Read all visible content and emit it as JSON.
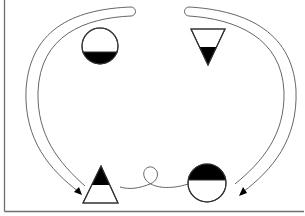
{
  "diagram": {
    "background_color": "#ffffff",
    "line_color": "#555555",
    "fill_color": "#000000",
    "frame": {
      "visible_edges": [
        "left",
        "bottom"
      ],
      "color": "#6e6e6e"
    },
    "shapes": [
      {
        "id": "top-left",
        "type": "circle",
        "filled_part": "bottom",
        "center": [
          100,
          46
        ],
        "radius": 18
      },
      {
        "id": "top-right",
        "type": "triangle-pointing-down",
        "filled_part": "bottom-tip",
        "points": [
          [
            191,
            29
          ],
          [
            225,
            29
          ],
          [
            208,
            65
          ]
        ]
      },
      {
        "id": "bottom-left",
        "type": "triangle-pointing-up",
        "filled_part": "top-tip",
        "points": [
          [
            101,
            166
          ],
          [
            118,
            203
          ],
          [
            83,
            203
          ]
        ]
      },
      {
        "id": "bottom-right",
        "type": "circle",
        "filled_part": "top",
        "center": [
          207,
          183
        ],
        "radius": 19
      }
    ],
    "arrows": [
      {
        "id": "left-arrow",
        "from": "top-center",
        "to": "bottom-left",
        "style": "double-line curved arrow"
      },
      {
        "id": "right-arrow",
        "from": "top-center",
        "to": "bottom-right",
        "style": "double-line curved arrow"
      }
    ],
    "connectors": [
      {
        "id": "loop-connector",
        "from": "bottom-left",
        "to": "bottom-right",
        "style": "curly line with loop"
      }
    ]
  }
}
